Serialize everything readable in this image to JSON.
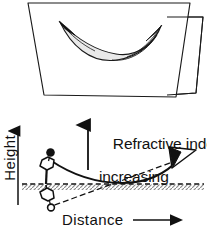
{
  "figure": {
    "background_color": "#ffffff",
    "ink_color": "#000000",
    "shade_color": "#e8e8e8",
    "ground_color": "#b4b4b4"
  },
  "top_panel": {
    "name": "three-dimensional-ray-surface-panel",
    "description": "Parallelogram plane carrying a curved saddle shaped ray surface, with a folded quadrilateral flap on the right edge",
    "plane_outline": "28,3 190,3 176,97 44,95",
    "flap_outline": "167,17 203,17 196,93 167,95",
    "ribbon_upper_edge": "60,22 82,40 112,52 140,46 160,26",
    "ribbon_lower_edge": "60,22 86,49 115,58 141,52 160,26"
  },
  "bottom_panel": {
    "name": "mirage-ray-path-panel",
    "ground_line_y": 184,
    "axes": {
      "height_label": "Height",
      "distance_label": "Distance",
      "height_arrow": "up",
      "distance_arrow": "right"
    },
    "annotation": {
      "line1": "Refractive index",
      "line2": "increasing",
      "arrow_direction": "up"
    },
    "object": {
      "name": "object-tree-upright",
      "description": "Small upright tree with dark round crown standing on the ground line"
    },
    "mirage_image": {
      "name": "inverted-mirage-image",
      "description": "Inverted mirror image of the tree drawn below the ground line"
    },
    "observer": {
      "name": "observer-eye",
      "description": "Eye symbol at the right end of the curved ray"
    },
    "rays": {
      "curved_ray_style": "solid",
      "apparent_ray_style": "dashed"
    }
  }
}
